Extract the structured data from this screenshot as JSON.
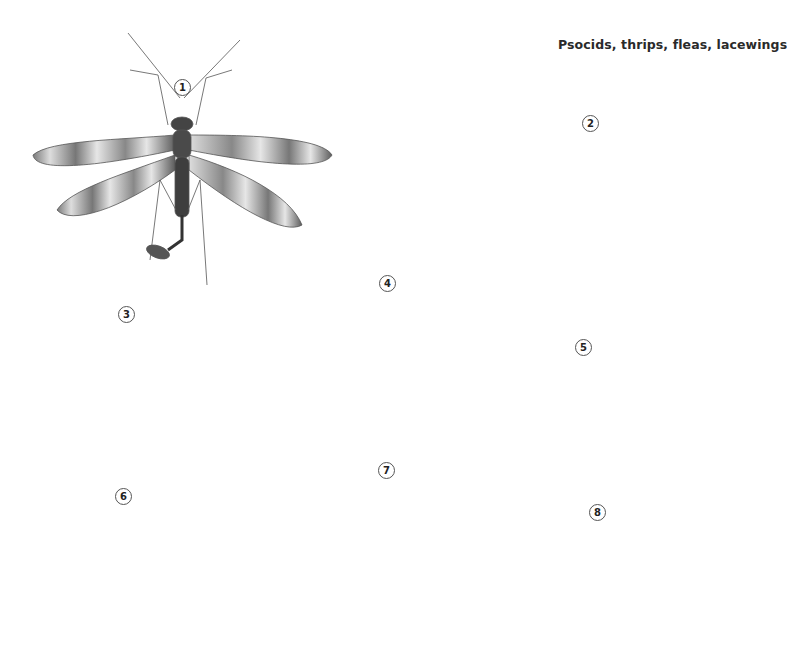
{
  "plate": {
    "title": "Psocids, thrips, fleas, lacewings",
    "specimens": [
      {
        "number": "1",
        "type": "scorpionfly",
        "wings": "banded",
        "x": 182,
        "y": 87
      },
      {
        "number": "2",
        "type": "lacewing",
        "wings": "net-veined, pale",
        "x": 590,
        "y": 123
      },
      {
        "number": "3",
        "type": "thrips",
        "wings": "fringed",
        "x": 126,
        "y": 314
      },
      {
        "number": "4",
        "type": "winged psocid",
        "wings": "veined",
        "x": 387,
        "y": 283
      },
      {
        "number": "5",
        "type": "flea",
        "view": "side",
        "x": 583,
        "y": 347
      },
      {
        "number": "6",
        "type": "thrips",
        "wings": "fringed",
        "x": 123,
        "y": 496
      },
      {
        "number": "7",
        "type": "wingless psocid (booklouse)",
        "x": 386,
        "y": 470
      },
      {
        "number": "8",
        "type": "flea",
        "view": "side",
        "x": 597,
        "y": 512
      }
    ]
  },
  "colors": {
    "background": "#ffffff",
    "ink": "#333333",
    "wing_band": "#6a6a6a",
    "wing_pale": "#e9e9e9"
  }
}
